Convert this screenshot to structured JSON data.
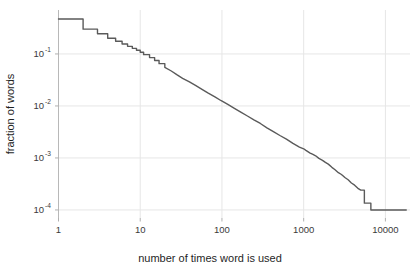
{
  "chart_data": {
    "type": "line",
    "title": "",
    "xlabel": "number of times word is used",
    "ylabel": "fraction of words",
    "xscale": "log",
    "yscale": "log",
    "xlim": [
      1,
      20000
    ],
    "ylim": [
      7e-05,
      0.7
    ],
    "grid": true,
    "legend": null,
    "xticks": [
      1,
      10,
      100,
      1000,
      10000
    ],
    "xtick_labels": [
      "1",
      "10",
      "100",
      "1000",
      "10000"
    ],
    "yticks": [
      0.1,
      0.01,
      0.001,
      0.0001
    ],
    "ytick_labels": [
      "10-1",
      "10-2",
      "10-3",
      "10-4"
    ],
    "ytick_mantissa": "10",
    "ytick_exponents": [
      "-1",
      "-2",
      "-3",
      "-4"
    ],
    "series": [
      {
        "name": "fraction of words",
        "color": "#5a5a5a",
        "x": [
          1,
          2,
          2,
          3,
          3,
          4,
          4,
          5,
          5,
          6,
          6,
          7,
          7,
          8,
          8,
          9,
          9,
          10,
          10,
          11,
          11,
          13,
          13,
          15,
          15,
          17,
          17,
          20,
          20,
          24,
          28,
          33,
          40,
          48,
          57,
          68,
          82,
          98,
          118,
          142,
          170,
          205,
          246,
          295,
          355,
          426,
          512,
          615,
          739,
          887,
          1000,
          1065,
          1200,
          1280,
          1400,
          1536,
          1700,
          1845,
          2000,
          2215,
          2400,
          2660,
          2900,
          3195,
          3500,
          3837,
          4200,
          4608,
          5000,
          5530,
          5530,
          6000,
          6640,
          6640,
          7000,
          8000,
          9000,
          10000,
          12000,
          15000,
          18000
        ],
        "y": [
          0.47,
          0.47,
          0.3,
          0.3,
          0.245,
          0.245,
          0.2,
          0.2,
          0.175,
          0.175,
          0.155,
          0.155,
          0.14,
          0.14,
          0.128,
          0.128,
          0.118,
          0.118,
          0.108,
          0.108,
          0.097,
          0.097,
          0.085,
          0.085,
          0.075,
          0.075,
          0.065,
          0.065,
          0.055,
          0.047,
          0.04,
          0.034,
          0.029,
          0.0245,
          0.0208,
          0.0176,
          0.0149,
          0.0126,
          0.0107,
          0.009,
          0.0076,
          0.0064,
          0.0054,
          0.0046,
          0.0038,
          0.0032,
          0.0027,
          0.0023,
          0.0019,
          0.00162,
          0.0015,
          0.0014,
          0.00124,
          0.00118,
          0.0011,
          0.00098,
          0.0009,
          0.00082,
          0.00076,
          0.00066,
          0.0006,
          0.00052,
          0.00048,
          0.00042,
          0.00038,
          0.00033,
          0.0003,
          0.00026,
          0.00024,
          0.00024,
          0.000135,
          0.000135,
          0.000135,
          0.0001,
          0.0001,
          0.0001,
          0.0001,
          0.0001,
          0.0001,
          0.0001,
          0.0001
        ]
      }
    ]
  },
  "axes": {
    "x_title": "number of times word is used",
    "y_title": "fraction of words"
  }
}
